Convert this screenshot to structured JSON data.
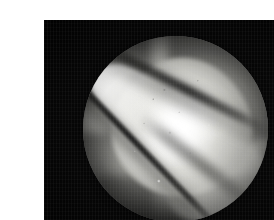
{
  "image": {
    "kind": "arthroscopic-photograph",
    "caption": "",
    "alt_text": "Arthroscopic view: circular endoscopic field of view on a black background showing a bright white cartilage/bone surface crossed by dark diagonal clefts.",
    "background_color": "#040404",
    "paper_margin_color": "#ffffff",
    "field_of_view": {
      "shape": "circle",
      "center_x": 135,
      "center_y": 112,
      "radius": 92
    },
    "regions": [
      {
        "name": "bright-cartilage-mass",
        "tone": "highlight",
        "color": "#ffffff"
      },
      {
        "name": "specular-hotspot",
        "tone": "highlight",
        "color": "#ffffff"
      },
      {
        "name": "blade-highlight-upper-left",
        "tone": "highlight",
        "color": "#fafaf8"
      },
      {
        "name": "facet-lower-right",
        "tone": "midtone",
        "color": "#d7d7d2"
      },
      {
        "name": "soft-tissue-upper-right",
        "tone": "shadow",
        "color": "#56564f"
      },
      {
        "name": "soft-tissue-upper-left",
        "tone": "shadow",
        "color": "#38382f"
      },
      {
        "name": "recess-lower-left",
        "tone": "shadow",
        "color": "#3c3c38"
      },
      {
        "name": "shadow-arc-bottom",
        "tone": "shadow",
        "color": "#30302e"
      }
    ],
    "linear_features": [
      {
        "name": "main-cleft",
        "orientation_deg": 46,
        "tone": "dark"
      },
      {
        "name": "upper-cleft",
        "orientation_deg": 27,
        "tone": "dark"
      },
      {
        "name": "right-cleft",
        "orientation_deg": 38,
        "tone": "dark"
      }
    ],
    "dimensions": {
      "width": 274,
      "height": 220
    }
  }
}
